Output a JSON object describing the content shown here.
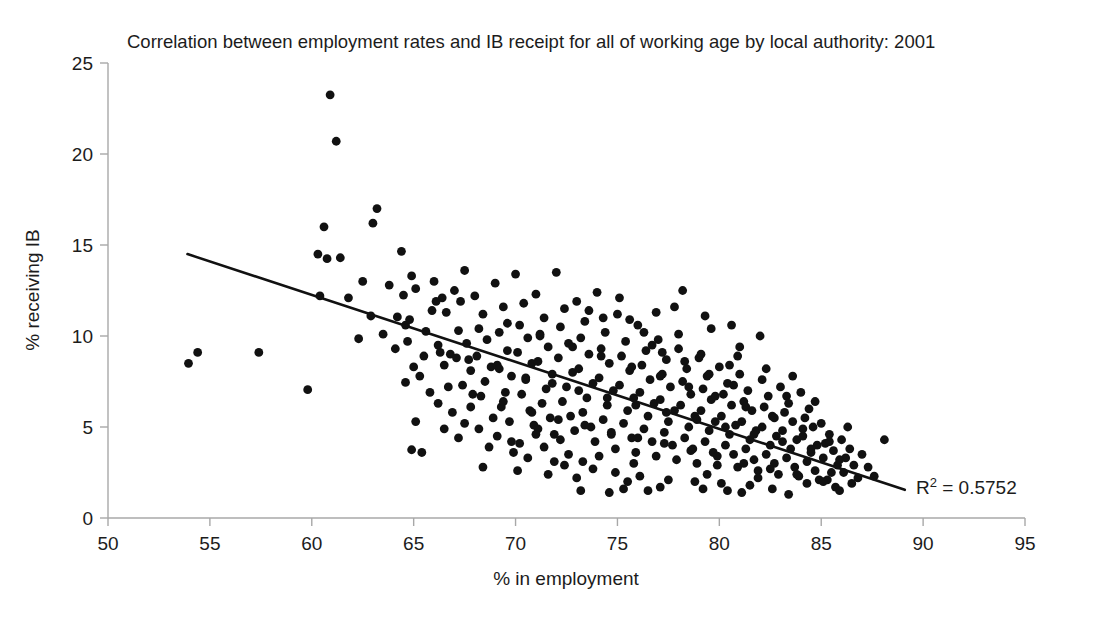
{
  "chart_data": {
    "type": "scatter",
    "title": "Correlation between employment rates and IB receipt for all of working age by local authority: 2001",
    "xlabel": "% in employment",
    "ylabel": "% receiving IB",
    "xlim": [
      50,
      95
    ],
    "ylim": [
      0,
      25
    ],
    "xticks": [
      50,
      55,
      60,
      65,
      70,
      75,
      80,
      85,
      90,
      95
    ],
    "yticks": [
      0,
      5,
      10,
      15,
      20,
      25
    ],
    "grid": false,
    "legend": false,
    "annotations": [
      {
        "text": "R² = 0.5752",
        "x": 89.5,
        "y": 1.9
      }
    ],
    "trendline": {
      "type": "linear",
      "x_start": 53.9,
      "y_start": 14.5,
      "x_end": 89.1,
      "y_end": 1.55,
      "r_squared": 0.5752
    },
    "point_color": "#111111",
    "line_color": "#111111",
    "axis_color": "#a8a8a8",
    "n_points": 376,
    "points": [
      [
        53.95,
        8.5
      ],
      [
        54.4,
        9.1
      ],
      [
        57.4,
        9.1
      ],
      [
        59.8,
        7.05
      ],
      [
        60.9,
        23.25
      ],
      [
        61.2,
        20.7
      ],
      [
        60.6,
        16.0
      ],
      [
        61.4,
        14.3
      ],
      [
        60.3,
        14.5
      ],
      [
        60.4,
        12.2
      ],
      [
        62.3,
        9.85
      ],
      [
        63.2,
        17.0
      ],
      [
        63.0,
        16.2
      ],
      [
        60.75,
        14.25
      ],
      [
        64.4,
        14.65
      ],
      [
        64.9,
        13.3
      ],
      [
        65.1,
        12.6
      ],
      [
        64.5,
        12.25
      ],
      [
        64.2,
        11.05
      ],
      [
        64.6,
        10.6
      ],
      [
        64.8,
        10.9
      ],
      [
        65.0,
        8.3
      ],
      [
        64.6,
        7.45
      ],
      [
        65.1,
        5.3
      ],
      [
        64.9,
        3.75
      ],
      [
        65.4,
        3.6
      ],
      [
        65.6,
        10.25
      ],
      [
        65.9,
        11.4
      ],
      [
        66.0,
        13.0
      ],
      [
        66.4,
        12.1
      ],
      [
        66.6,
        11.3
      ],
      [
        66.2,
        9.5
      ],
      [
        66.8,
        9.0
      ],
      [
        66.5,
        8.4
      ],
      [
        67.0,
        12.5
      ],
      [
        67.3,
        11.9
      ],
      [
        67.5,
        13.6
      ],
      [
        67.2,
        10.3
      ],
      [
        67.6,
        9.6
      ],
      [
        67.1,
        8.8
      ],
      [
        67.8,
        8.1
      ],
      [
        67.4,
        7.3
      ],
      [
        68.0,
        12.2
      ],
      [
        68.4,
        11.2
      ],
      [
        68.2,
        10.4
      ],
      [
        68.6,
        9.8
      ],
      [
        68.1,
        8.9
      ],
      [
        68.8,
        8.3
      ],
      [
        68.5,
        7.5
      ],
      [
        68.3,
        6.7
      ],
      [
        69.0,
        12.9
      ],
      [
        69.4,
        11.6
      ],
      [
        69.2,
        10.2
      ],
      [
        69.6,
        9.2
      ],
      [
        69.1,
        8.4
      ],
      [
        69.8,
        7.8
      ],
      [
        69.5,
        6.9
      ],
      [
        69.3,
        6.1
      ],
      [
        69.7,
        5.3
      ],
      [
        70.0,
        13.4
      ],
      [
        70.4,
        11.8
      ],
      [
        70.2,
        10.6
      ],
      [
        70.6,
        9.9
      ],
      [
        70.1,
        9.1
      ],
      [
        70.8,
        8.5
      ],
      [
        70.5,
        7.6
      ],
      [
        70.3,
        6.8
      ],
      [
        70.7,
        5.9
      ],
      [
        70.9,
        5.1
      ],
      [
        71.0,
        12.3
      ],
      [
        71.4,
        11.0
      ],
      [
        71.2,
        10.1
      ],
      [
        71.6,
        9.4
      ],
      [
        71.1,
        8.6
      ],
      [
        71.8,
        7.9
      ],
      [
        71.5,
        7.1
      ],
      [
        71.3,
        6.3
      ],
      [
        71.7,
        5.5
      ],
      [
        71.9,
        4.6
      ],
      [
        72.0,
        13.5
      ],
      [
        72.4,
        11.5
      ],
      [
        72.2,
        10.5
      ],
      [
        72.6,
        9.6
      ],
      [
        72.1,
        8.8
      ],
      [
        72.8,
        8.0
      ],
      [
        72.5,
        7.2
      ],
      [
        72.3,
        6.4
      ],
      [
        72.7,
        5.6
      ],
      [
        72.9,
        4.8
      ],
      [
        73.0,
        11.9
      ],
      [
        73.4,
        10.8
      ],
      [
        73.2,
        9.9
      ],
      [
        73.6,
        9.0
      ],
      [
        73.1,
        8.2
      ],
      [
        73.8,
        7.4
      ],
      [
        73.5,
        6.6
      ],
      [
        73.3,
        5.8
      ],
      [
        73.7,
        5.0
      ],
      [
        73.9,
        4.2
      ],
      [
        74.0,
        12.4
      ],
      [
        74.4,
        10.2
      ],
      [
        74.2,
        9.3
      ],
      [
        74.6,
        8.5
      ],
      [
        74.1,
        7.7
      ],
      [
        74.8,
        7.0
      ],
      [
        74.5,
        6.2
      ],
      [
        74.3,
        5.4
      ],
      [
        74.7,
        4.6
      ],
      [
        74.9,
        3.8
      ],
      [
        75.0,
        11.2
      ],
      [
        75.4,
        9.7
      ],
      [
        75.2,
        8.9
      ],
      [
        75.6,
        8.1
      ],
      [
        75.1,
        7.3
      ],
      [
        75.8,
        6.6
      ],
      [
        75.5,
        5.9
      ],
      [
        75.3,
        5.2
      ],
      [
        75.7,
        4.4
      ],
      [
        75.9,
        3.6
      ],
      [
        76.0,
        10.6
      ],
      [
        76.4,
        9.2
      ],
      [
        76.2,
        8.4
      ],
      [
        76.6,
        7.6
      ],
      [
        76.1,
        6.9
      ],
      [
        76.8,
        6.3
      ],
      [
        76.5,
        5.6
      ],
      [
        76.3,
        4.9
      ],
      [
        76.7,
        4.2
      ],
      [
        76.9,
        3.4
      ],
      [
        77.0,
        9.8
      ],
      [
        77.4,
        8.7
      ],
      [
        77.2,
        7.9
      ],
      [
        77.6,
        7.2
      ],
      [
        77.1,
        6.5
      ],
      [
        77.8,
        5.9
      ],
      [
        77.5,
        5.3
      ],
      [
        77.3,
        4.7
      ],
      [
        77.7,
        4.0
      ],
      [
        77.9,
        3.2
      ],
      [
        78.0,
        9.3
      ],
      [
        78.4,
        8.2
      ],
      [
        78.2,
        7.5
      ],
      [
        78.6,
        6.8
      ],
      [
        78.1,
        6.2
      ],
      [
        78.8,
        5.6
      ],
      [
        78.5,
        5.0
      ],
      [
        78.3,
        4.4
      ],
      [
        78.7,
        3.8
      ],
      [
        78.9,
        3.0
      ],
      [
        79.0,
        8.8
      ],
      [
        79.4,
        7.8
      ],
      [
        79.2,
        7.1
      ],
      [
        79.6,
        6.5
      ],
      [
        79.1,
        5.9
      ],
      [
        79.8,
        5.3
      ],
      [
        79.5,
        4.8
      ],
      [
        79.3,
        4.2
      ],
      [
        79.7,
        3.6
      ],
      [
        79.9,
        2.9
      ],
      [
        80.0,
        8.3
      ],
      [
        80.4,
        7.4
      ],
      [
        80.2,
        6.8
      ],
      [
        80.6,
        6.2
      ],
      [
        80.1,
        5.6
      ],
      [
        80.8,
        5.1
      ],
      [
        80.5,
        4.6
      ],
      [
        80.3,
        4.0
      ],
      [
        80.7,
        3.5
      ],
      [
        80.9,
        2.8
      ],
      [
        81.0,
        7.9
      ],
      [
        81.4,
        7.0
      ],
      [
        81.2,
        6.4
      ],
      [
        81.6,
        5.9
      ],
      [
        81.1,
        5.3
      ],
      [
        81.8,
        4.8
      ],
      [
        81.5,
        4.3
      ],
      [
        81.3,
        3.8
      ],
      [
        81.7,
        3.2
      ],
      [
        81.9,
        2.6
      ],
      [
        82.0,
        10.0
      ],
      [
        82.4,
        6.7
      ],
      [
        82.2,
        6.1
      ],
      [
        82.6,
        5.6
      ],
      [
        82.1,
        5.0
      ],
      [
        82.8,
        4.5
      ],
      [
        82.5,
        4.0
      ],
      [
        82.3,
        3.5
      ],
      [
        82.7,
        3.0
      ],
      [
        82.9,
        2.4
      ],
      [
        83.0,
        7.2
      ],
      [
        83.4,
        6.3
      ],
      [
        83.2,
        5.8
      ],
      [
        83.6,
        5.3
      ],
      [
        83.1,
        4.8
      ],
      [
        83.8,
        4.3
      ],
      [
        83.5,
        3.8
      ],
      [
        83.3,
        3.3
      ],
      [
        83.7,
        2.8
      ],
      [
        83.9,
        2.3
      ],
      [
        84.0,
        6.9
      ],
      [
        84.4,
        6.0
      ],
      [
        84.2,
        5.5
      ],
      [
        84.6,
        5.0
      ],
      [
        84.1,
        4.5
      ],
      [
        84.8,
        4.0
      ],
      [
        84.5,
        3.6
      ],
      [
        84.3,
        3.1
      ],
      [
        84.7,
        2.6
      ],
      [
        84.9,
        2.1
      ],
      [
        85.0,
        5.2
      ],
      [
        85.4,
        4.6
      ],
      [
        85.2,
        4.1
      ],
      [
        85.6,
        3.7
      ],
      [
        85.1,
        3.3
      ],
      [
        85.8,
        2.9
      ],
      [
        85.5,
        2.5
      ],
      [
        85.3,
        2.1
      ],
      [
        85.7,
        1.7
      ],
      [
        85.9,
        1.5
      ],
      [
        86.0,
        4.3
      ],
      [
        86.4,
        3.8
      ],
      [
        86.2,
        3.3
      ],
      [
        86.6,
        2.9
      ],
      [
        86.1,
        2.5
      ],
      [
        86.8,
        2.2
      ],
      [
        86.5,
        1.9
      ],
      [
        87.0,
        3.5
      ],
      [
        87.3,
        2.8
      ],
      [
        87.6,
        2.3
      ],
      [
        88.1,
        4.3
      ],
      [
        73.2,
        1.5
      ],
      [
        74.6,
        1.4
      ],
      [
        75.3,
        1.6
      ],
      [
        76.5,
        1.5
      ],
      [
        77.1,
        1.7
      ],
      [
        79.2,
        1.6
      ],
      [
        80.4,
        1.5
      ],
      [
        81.1,
        1.4
      ],
      [
        82.6,
        1.6
      ],
      [
        83.4,
        1.3
      ],
      [
        66.2,
        6.3
      ],
      [
        66.9,
        5.8
      ],
      [
        67.5,
        5.2
      ],
      [
        68.2,
        4.9
      ],
      [
        69.1,
        4.5
      ],
      [
        70.2,
        4.1
      ],
      [
        71.4,
        3.9
      ],
      [
        72.6,
        3.5
      ],
      [
        65.8,
        6.9
      ],
      [
        67.8,
        6.1
      ],
      [
        68.9,
        5.5
      ],
      [
        71.1,
        4.9
      ],
      [
        62.9,
        11.1
      ],
      [
        63.5,
        10.1
      ],
      [
        64.1,
        9.3
      ],
      [
        65.5,
        8.9
      ],
      [
        66.1,
        11.9
      ],
      [
        63.8,
        12.8
      ],
      [
        62.5,
        13.0
      ],
      [
        61.8,
        12.1
      ],
      [
        75.6,
        10.9
      ],
      [
        76.3,
        10.2
      ],
      [
        74.3,
        11.0
      ],
      [
        73.6,
        11.4
      ],
      [
        77.2,
        9.1
      ],
      [
        78.3,
        8.6
      ],
      [
        79.5,
        7.9
      ],
      [
        80.7,
        7.3
      ],
      [
        68.7,
        3.9
      ],
      [
        69.9,
        3.6
      ],
      [
        70.6,
        3.3
      ],
      [
        71.9,
        3.1
      ],
      [
        72.4,
        2.9
      ],
      [
        73.8,
        2.7
      ],
      [
        74.9,
        2.5
      ],
      [
        76.1,
        2.3
      ],
      [
        77.5,
        2.1
      ],
      [
        78.8,
        2.0
      ],
      [
        80.1,
        1.9
      ],
      [
        81.5,
        1.8
      ],
      [
        65.3,
        7.8
      ],
      [
        66.7,
        7.2
      ],
      [
        67.9,
        6.8
      ],
      [
        69.4,
        6.4
      ],
      [
        70.8,
        5.8
      ],
      [
        72.1,
        5.4
      ],
      [
        73.4,
        5.1
      ],
      [
        74.7,
        4.7
      ],
      [
        76.0,
        4.4
      ],
      [
        77.3,
        4.1
      ],
      [
        78.6,
        3.7
      ],
      [
        79.9,
        3.4
      ],
      [
        81.2,
        3.0
      ],
      [
        82.5,
        2.7
      ],
      [
        83.8,
        2.4
      ],
      [
        85.1,
        2.0
      ],
      [
        64.7,
        9.7
      ],
      [
        66.3,
        9.1
      ],
      [
        67.7,
        8.7
      ],
      [
        69.2,
        8.2
      ],
      [
        70.5,
        7.7
      ],
      [
        71.8,
        7.4
      ],
      [
        73.1,
        7.0
      ],
      [
        74.5,
        6.6
      ],
      [
        75.9,
        6.2
      ],
      [
        77.4,
        5.8
      ],
      [
        78.9,
        5.4
      ],
      [
        80.3,
        5.0
      ],
      [
        81.7,
        4.6
      ],
      [
        83.1,
        4.2
      ],
      [
        84.5,
        3.8
      ],
      [
        85.9,
        3.2
      ],
      [
        69.6,
        10.7
      ],
      [
        71.2,
        10.0
      ],
      [
        72.8,
        9.4
      ],
      [
        74.2,
        8.9
      ],
      [
        75.7,
        8.3
      ],
      [
        77.1,
        7.8
      ],
      [
        78.5,
        7.2
      ],
      [
        79.8,
        6.7
      ],
      [
        81.3,
        6.1
      ],
      [
        82.7,
        5.5
      ],
      [
        84.1,
        4.9
      ],
      [
        85.4,
        4.2
      ],
      [
        79.1,
        9.0
      ],
      [
        80.5,
        8.4
      ],
      [
        76.7,
        9.5
      ],
      [
        78.0,
        10.1
      ],
      [
        75.1,
        12.1
      ],
      [
        76.9,
        11.3
      ],
      [
        79.6,
        10.4
      ],
      [
        83.3,
        6.7
      ],
      [
        84.7,
        6.4
      ],
      [
        82.1,
        7.6
      ],
      [
        80.9,
        8.9
      ],
      [
        86.3,
        5.0
      ],
      [
        68.4,
        2.8
      ],
      [
        70.1,
        2.6
      ],
      [
        71.6,
        2.4
      ],
      [
        73.0,
        2.2
      ],
      [
        75.5,
        2.0
      ],
      [
        79.4,
        2.4
      ],
      [
        81.9,
        2.2
      ],
      [
        84.3,
        1.9
      ],
      [
        73.3,
        3.1
      ],
      [
        74.1,
        3.4
      ],
      [
        75.8,
        3.0
      ],
      [
        72.2,
        4.3
      ],
      [
        71.0,
        4.6
      ],
      [
        67.2,
        4.4
      ],
      [
        66.5,
        4.9
      ],
      [
        69.8,
        4.2
      ],
      [
        82.3,
        8.2
      ],
      [
        83.6,
        7.8
      ],
      [
        81.0,
        9.4
      ],
      [
        77.8,
        11.6
      ],
      [
        78.2,
        12.5
      ],
      [
        79.3,
        11.1
      ],
      [
        80.6,
        10.6
      ]
    ]
  }
}
